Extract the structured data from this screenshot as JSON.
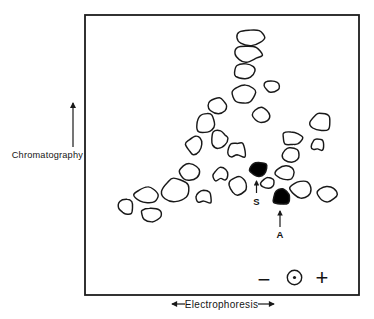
{
  "figure": {
    "axes": {
      "vertical": {
        "label": "Chromatography",
        "arrow_direction": "up"
      },
      "horizontal": {
        "label": "Electrophoresis",
        "arrow_direction": "left-and-right"
      }
    },
    "polarity": {
      "negative": "−",
      "positive": "+",
      "origin_symbol": "circled-dot"
    },
    "spot_labels": {
      "s": "S",
      "a": "A"
    },
    "colors": {
      "ink": "#191919",
      "paper": "#ffffff",
      "solid_spot_fill": "#000000"
    }
  },
  "chart_data": {
    "type": "scatter",
    "coordinate_space": "image pixels, 374x319, y increases downward",
    "plot_box": {
      "x": 85,
      "y": 15,
      "width": 274,
      "height": 280
    },
    "open_spots": [
      {
        "cx": 250,
        "cy": 37,
        "rx": 13,
        "ry": 7.5,
        "seed": 11
      },
      {
        "cx": 247,
        "cy": 54,
        "rx": 14,
        "ry": 8,
        "seed": 22
      },
      {
        "cx": 244,
        "cy": 72,
        "rx": 10.5,
        "ry": 7.5,
        "seed": 33
      },
      {
        "cx": 272,
        "cy": 86,
        "rx": 8.5,
        "ry": 6,
        "seed": 44
      },
      {
        "cx": 244,
        "cy": 94,
        "rx": 10.5,
        "ry": 9.5,
        "seed": 55
      },
      {
        "cx": 261,
        "cy": 115,
        "rx": 8,
        "ry": 7,
        "seed": 66
      },
      {
        "cx": 218,
        "cy": 106,
        "rx": 9.5,
        "ry": 7.5,
        "seed": 77
      },
      {
        "cx": 206,
        "cy": 123,
        "rx": 9.5,
        "ry": 10.5,
        "seed": 88
      },
      {
        "cx": 219,
        "cy": 140,
        "rx": 8.5,
        "ry": 9,
        "seed": 99
      },
      {
        "cx": 194,
        "cy": 145,
        "rx": 8,
        "ry": 8.5,
        "seed": 110
      },
      {
        "cx": 237,
        "cy": 151,
        "rx": 8.5,
        "ry": 8.5,
        "seed": 121,
        "notch": true
      },
      {
        "cx": 190,
        "cy": 171,
        "rx": 9.5,
        "ry": 8.5,
        "seed": 132
      },
      {
        "cx": 221,
        "cy": 175,
        "rx": 7.5,
        "ry": 7.5,
        "seed": 143,
        "notch": true
      },
      {
        "cx": 175,
        "cy": 190,
        "rx": 12.5,
        "ry": 10.5,
        "seed": 154
      },
      {
        "cx": 147,
        "cy": 195,
        "rx": 11.5,
        "ry": 8,
        "seed": 165
      },
      {
        "cx": 204,
        "cy": 198,
        "rx": 7.5,
        "ry": 7,
        "seed": 176,
        "notch": true
      },
      {
        "cx": 126,
        "cy": 207,
        "rx": 7,
        "ry": 7.5,
        "seed": 187
      },
      {
        "cx": 151,
        "cy": 215,
        "rx": 10.5,
        "ry": 8,
        "seed": 198
      },
      {
        "cx": 238,
        "cy": 186,
        "rx": 9,
        "ry": 8.5,
        "seed": 209
      },
      {
        "cx": 268,
        "cy": 183,
        "rx": 6.5,
        "ry": 5.5,
        "seed": 220
      },
      {
        "cx": 285,
        "cy": 173,
        "rx": 9,
        "ry": 7.5,
        "seed": 231
      },
      {
        "cx": 301,
        "cy": 189,
        "rx": 10.5,
        "ry": 9,
        "seed": 242
      },
      {
        "cx": 327,
        "cy": 194,
        "rx": 9.5,
        "ry": 8,
        "seed": 253
      },
      {
        "cx": 321,
        "cy": 122,
        "rx": 10,
        "ry": 9,
        "seed": 264
      },
      {
        "cx": 292,
        "cy": 138,
        "rx": 9.5,
        "ry": 7,
        "seed": 275
      },
      {
        "cx": 318,
        "cy": 146,
        "rx": 6.5,
        "ry": 6.5,
        "seed": 286,
        "notch": true
      },
      {
        "cx": 290,
        "cy": 155,
        "rx": 9,
        "ry": 7,
        "seed": 297
      }
    ],
    "solid_spots": [
      {
        "label": "S",
        "cx": 259,
        "cy": 169,
        "rx": 8.5,
        "ry": 7.5,
        "seed": 308
      },
      {
        "label": "A",
        "cx": 281,
        "cy": 197,
        "rx": 8.5,
        "ry": 8,
        "seed": 319
      }
    ]
  }
}
